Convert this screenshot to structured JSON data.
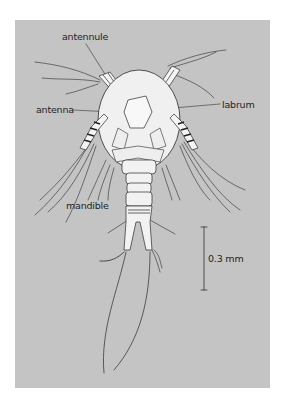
{
  "figure": {
    "background_color": "#c4c4c4",
    "line_color": "#2a2a2a",
    "body_fill": "#f2f2f2"
  },
  "labels": {
    "antennule": "antennule",
    "antenna": "antenna",
    "labrum": "labrum",
    "mandible": "mandible"
  },
  "scale_bar": {
    "label": "0.3 mm",
    "value": 0.3,
    "unit": "mm"
  }
}
